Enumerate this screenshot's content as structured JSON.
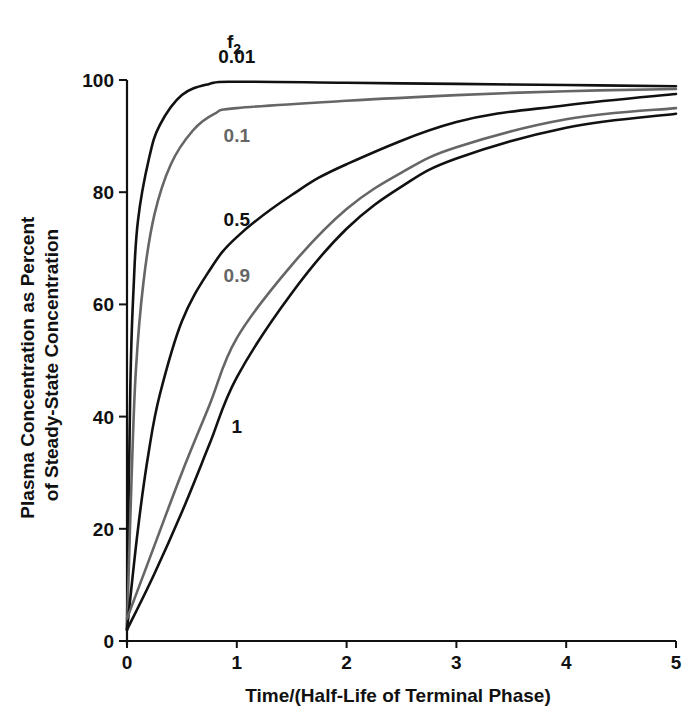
{
  "chart_data": {
    "type": "line",
    "title": "",
    "legend_title": "f2",
    "xlabel": "Time/(Half-Life of Terminal Phase)",
    "ylabel_lines": [
      "Plasma Concentration as Percent",
      "of Steady-State Concentration"
    ],
    "xlim": [
      0,
      5
    ],
    "ylim": [
      0,
      100
    ],
    "xticks": [
      0,
      1,
      2,
      3,
      4,
      5
    ],
    "yticks": [
      0,
      20,
      40,
      60,
      80,
      100
    ],
    "grid": false,
    "series": [
      {
        "name": "0.01",
        "color": "#111111",
        "label_at": [
          1,
          103
        ],
        "points": [
          [
            0,
            2
          ],
          [
            0.03,
            45
          ],
          [
            0.06,
            63
          ],
          [
            0.1,
            75
          ],
          [
            0.2,
            86
          ],
          [
            0.3,
            92
          ],
          [
            0.5,
            97.3
          ],
          [
            0.75,
            99.3
          ],
          [
            1,
            99.7
          ],
          [
            2,
            99.5
          ],
          [
            3,
            99.3
          ],
          [
            4,
            99.1
          ],
          [
            5,
            98.9
          ]
        ]
      },
      {
        "name": "0.1",
        "color": "#666666",
        "label_at": [
          1,
          89
        ],
        "points": [
          [
            0,
            2
          ],
          [
            0.04,
            28
          ],
          [
            0.08,
            48
          ],
          [
            0.15,
            64
          ],
          [
            0.25,
            76
          ],
          [
            0.4,
            85
          ],
          [
            0.6,
            91
          ],
          [
            0.8,
            94
          ],
          [
            1,
            95
          ],
          [
            2,
            96.3
          ],
          [
            3,
            97.3
          ],
          [
            4,
            98
          ],
          [
            5,
            98.4
          ]
        ]
      },
      {
        "name": "0.5",
        "color": "#111111",
        "label_at": [
          1,
          74
        ],
        "points": [
          [
            0,
            2
          ],
          [
            0.1,
            20
          ],
          [
            0.2,
            34
          ],
          [
            0.3,
            44
          ],
          [
            0.5,
            57
          ],
          [
            0.75,
            66
          ],
          [
            1,
            72
          ],
          [
            1.5,
            79.5
          ],
          [
            2,
            85
          ],
          [
            3,
            92.5
          ],
          [
            4,
            95.5
          ],
          [
            5,
            97.5
          ]
        ]
      },
      {
        "name": "0.9",
        "color": "#666666",
        "label_at": [
          1,
          64
        ],
        "points": [
          [
            0,
            4
          ],
          [
            0.25,
            17
          ],
          [
            0.5,
            30
          ],
          [
            0.75,
            42
          ],
          [
            1,
            54
          ],
          [
            1.5,
            67
          ],
          [
            2,
            77
          ],
          [
            2.5,
            83.5
          ],
          [
            3,
            88
          ],
          [
            4,
            93
          ],
          [
            5,
            95
          ]
        ]
      },
      {
        "name": "1",
        "color": "#111111",
        "label_at": [
          1,
          37
        ],
        "points": [
          [
            0,
            2
          ],
          [
            0.25,
            12
          ],
          [
            0.5,
            23
          ],
          [
            0.75,
            35
          ],
          [
            1,
            47
          ],
          [
            1.5,
            62
          ],
          [
            2,
            73.5
          ],
          [
            2.5,
            81
          ],
          [
            3,
            86
          ],
          [
            4,
            91.5
          ],
          [
            5,
            94
          ]
        ]
      }
    ]
  }
}
